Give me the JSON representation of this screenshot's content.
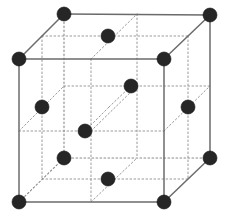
{
  "figure": {
    "name": "face-centered-cubic-unit-cell",
    "title": "",
    "caption": "",
    "projection": "oblique",
    "width": 227,
    "height": 220,
    "background_color": "#ffffff"
  },
  "style": {
    "atom_color": "#262626",
    "atom_radius": 7,
    "atom_stroke_color": "#111111",
    "atom_stroke_width": 0.6,
    "solid_edge_color": "#6b6b6b",
    "solid_edge_width": 1.5,
    "hidden_edge_color": "#8a8a8a",
    "hidden_edge_width": 1.1,
    "hidden_edge_dash": "1.6 2.4",
    "internal_guide_color": "#9a9a9a",
    "internal_guide_width": 1.0,
    "internal_guide_dash": "1.6 2.4"
  },
  "geometry": {
    "front_face": {
      "top_left": [
        19,
        59
      ],
      "top_right": [
        164,
        59
      ],
      "bottom_right": [
        164,
        202
      ],
      "bottom_left": [
        19,
        202
      ]
    },
    "back_face": {
      "top_left": [
        64,
        14
      ],
      "top_right": [
        210,
        15
      ],
      "bottom_right": [
        210,
        158
      ],
      "bottom_left": [
        64,
        158
      ]
    },
    "depth_offset": [
      45,
      -44
    ]
  },
  "atoms": {
    "corner_count": 8,
    "face_center_count": 6,
    "total_drawn": 14,
    "corners": [
      {
        "id": "corner-front-top-left",
        "label": "front top left",
        "x": 19,
        "y": 59,
        "position": "corner"
      },
      {
        "id": "corner-front-top-right",
        "label": "front top right",
        "x": 164,
        "y": 59,
        "position": "corner"
      },
      {
        "id": "corner-front-bottom-left",
        "label": "front bottom left",
        "x": 19,
        "y": 202,
        "position": "corner"
      },
      {
        "id": "corner-front-bottom-right",
        "label": "front bottom right",
        "x": 164,
        "y": 202,
        "position": "corner"
      },
      {
        "id": "corner-back-top-left",
        "label": "back top left",
        "x": 64,
        "y": 14,
        "position": "corner"
      },
      {
        "id": "corner-back-top-right",
        "label": "back top right",
        "x": 210,
        "y": 15,
        "position": "corner"
      },
      {
        "id": "corner-back-bottom-left",
        "label": "back bottom left",
        "x": 64,
        "y": 158,
        "position": "corner"
      },
      {
        "id": "corner-back-bottom-right",
        "label": "back bottom right",
        "x": 210,
        "y": 158,
        "position": "corner"
      }
    ],
    "face_centers": [
      {
        "id": "face-center-top",
        "label": "top face center",
        "x": 108,
        "y": 36,
        "position": "face-center"
      },
      {
        "id": "face-center-bottom",
        "label": "bottom face center",
        "x": 108,
        "y": 179,
        "position": "face-center"
      },
      {
        "id": "face-center-left",
        "label": "left face center",
        "x": 42,
        "y": 107,
        "position": "face-center"
      },
      {
        "id": "face-center-right",
        "label": "right face center",
        "x": 188,
        "y": 107,
        "position": "face-center"
      },
      {
        "id": "face-center-front",
        "label": "front face center",
        "x": 85,
        "y": 131,
        "position": "face-center"
      },
      {
        "id": "face-center-back",
        "label": "back face center",
        "x": 131,
        "y": 86,
        "position": "face-center"
      }
    ],
    "center_diagonal": [
      {
        "id": "face-center-front",
        "x": 85,
        "y": 131
      },
      {
        "id": "body-mid-point",
        "x": 109,
        "y": 107
      },
      {
        "id": "face-center-back",
        "x": 131,
        "y": 86
      }
    ]
  },
  "edges": {
    "solid": [
      {
        "id": "edge-front-top",
        "from": [
          19,
          59
        ],
        "to": [
          164,
          59
        ]
      },
      {
        "id": "edge-front-left",
        "from": [
          19,
          59
        ],
        "to": [
          19,
          202
        ]
      },
      {
        "id": "edge-front-right",
        "from": [
          164,
          59
        ],
        "to": [
          164,
          202
        ]
      },
      {
        "id": "edge-front-bottom",
        "from": [
          19,
          202
        ],
        "to": [
          164,
          202
        ]
      },
      {
        "id": "edge-back-top",
        "from": [
          64,
          14
        ],
        "to": [
          210,
          15
        ]
      },
      {
        "id": "edge-back-right",
        "from": [
          210,
          15
        ],
        "to": [
          210,
          158
        ]
      },
      {
        "id": "edge-connect-top-left",
        "from": [
          19,
          59
        ],
        "to": [
          64,
          14
        ]
      },
      {
        "id": "edge-connect-top-right",
        "from": [
          164,
          59
        ],
        "to": [
          210,
          15
        ]
      },
      {
        "id": "edge-connect-bottom-right",
        "from": [
          164,
          202
        ],
        "to": [
          210,
          158
        ]
      }
    ],
    "hidden": [
      {
        "id": "edge-back-left",
        "from": [
          64,
          14
        ],
        "to": [
          64,
          158
        ]
      },
      {
        "id": "edge-back-bottom",
        "from": [
          64,
          158
        ],
        "to": [
          210,
          158
        ]
      },
      {
        "id": "edge-connect-bottom-left",
        "from": [
          19,
          202
        ],
        "to": [
          64,
          158
        ]
      }
    ],
    "internal_guides": [
      {
        "id": "guide-horizontal-mid-front",
        "from": [
          19,
          131
        ],
        "to": [
          164,
          131
        ]
      },
      {
        "id": "guide-horizontal-mid-back",
        "from": [
          64,
          86
        ],
        "to": [
          210,
          86
        ]
      },
      {
        "id": "guide-vertical-mid-front",
        "from": [
          91,
          59
        ],
        "to": [
          91,
          202
        ]
      },
      {
        "id": "guide-vertical-mid-back",
        "from": [
          137,
          14
        ],
        "to": [
          137,
          158
        ]
      },
      {
        "id": "guide-depth-top-mid",
        "from": [
          91,
          59
        ],
        "to": [
          137,
          14
        ]
      },
      {
        "id": "guide-depth-bottom-mid",
        "from": [
          91,
          202
        ],
        "to": [
          137,
          158
        ]
      },
      {
        "id": "guide-depth-left-mid",
        "from": [
          19,
          131
        ],
        "to": [
          64,
          86
        ]
      },
      {
        "id": "guide-depth-right-mid",
        "from": [
          164,
          131
        ],
        "to": [
          210,
          86
        ]
      },
      {
        "id": "guide-depth-center",
        "from": [
          91,
          131
        ],
        "to": [
          137,
          86
        ]
      },
      {
        "id": "guide-cross-vertical-left",
        "from": [
          42,
          36
        ],
        "to": [
          42,
          179
        ]
      },
      {
        "id": "guide-cross-vertical-right",
        "from": [
          188,
          36
        ],
        "to": [
          188,
          179
        ]
      },
      {
        "id": "guide-top-face-horizontal",
        "from": [
          42,
          36
        ],
        "to": [
          188,
          36
        ]
      },
      {
        "id": "guide-bottom-face-horizontal",
        "from": [
          42,
          179
        ],
        "to": [
          188,
          179
        ]
      }
    ]
  }
}
